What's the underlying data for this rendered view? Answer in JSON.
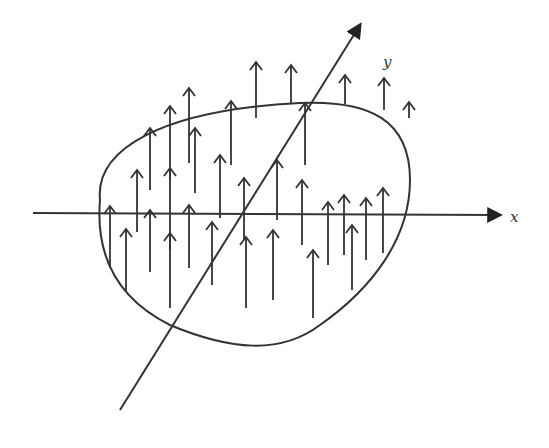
{
  "diagram": {
    "title": "",
    "colors": {
      "stroke": "#333333",
      "background": "#ffffff"
    },
    "axes": {
      "x": {
        "label": "x",
        "from": [
          33,
          213
        ],
        "to": [
          500,
          215
        ],
        "label_pos": [
          510,
          222
        ]
      },
      "y": {
        "label": "y",
        "from": [
          120,
          410
        ],
        "to": [
          360,
          25
        ],
        "label_pos": [
          383,
          67
        ]
      }
    },
    "region": {
      "shape": "closed-blob",
      "path": "M 100 200 C 95 150, 160 110, 300 103 C 370 100, 410 120, 410 180 C 410 240, 370 290, 320 325 C 280 355, 230 350, 170 325 C 120 300, 95 260, 100 200 Z"
    },
    "vectors": [
      {
        "x": 110,
        "top": 206,
        "bottom": 268
      },
      {
        "x": 126,
        "top": 229,
        "bottom": 292
      },
      {
        "x": 137,
        "top": 170,
        "bottom": 232
      },
      {
        "x": 150,
        "top": 210,
        "bottom": 272
      },
      {
        "x": 150,
        "top": 128,
        "bottom": 190
      },
      {
        "x": 170,
        "top": 168,
        "bottom": 250
      },
      {
        "x": 170,
        "top": 233,
        "bottom": 308
      },
      {
        "x": 170,
        "top": 106,
        "bottom": 180
      },
      {
        "x": 189,
        "top": 88,
        "bottom": 163
      },
      {
        "x": 189,
        "top": 205,
        "bottom": 268
      },
      {
        "x": 195,
        "top": 128,
        "bottom": 193
      },
      {
        "x": 220,
        "top": 155,
        "bottom": 218
      },
      {
        "x": 212,
        "top": 222,
        "bottom": 285
      },
      {
        "x": 231,
        "top": 101,
        "bottom": 165
      },
      {
        "x": 244,
        "top": 178,
        "bottom": 240
      },
      {
        "x": 246,
        "top": 237,
        "bottom": 308
      },
      {
        "x": 256,
        "top": 62,
        "bottom": 118
      },
      {
        "x": 277,
        "top": 160,
        "bottom": 220
      },
      {
        "x": 273,
        "top": 230,
        "bottom": 300
      },
      {
        "x": 291,
        "top": 65,
        "bottom": 104
      },
      {
        "x": 302,
        "top": 180,
        "bottom": 245
      },
      {
        "x": 305,
        "top": 103,
        "bottom": 165
      },
      {
        "x": 313,
        "top": 250,
        "bottom": 318
      },
      {
        "x": 328,
        "top": 202,
        "bottom": 265
      },
      {
        "x": 344,
        "top": 195,
        "bottom": 255
      },
      {
        "x": 345,
        "top": 75,
        "bottom": 104
      },
      {
        "x": 352,
        "top": 225,
        "bottom": 290
      },
      {
        "x": 366,
        "top": 198,
        "bottom": 260
      },
      {
        "x": 383,
        "top": 188,
        "bottom": 253
      },
      {
        "x": 384,
        "top": 78,
        "bottom": 110
      },
      {
        "x": 409,
        "top": 102,
        "bottom": 118
      }
    ]
  }
}
